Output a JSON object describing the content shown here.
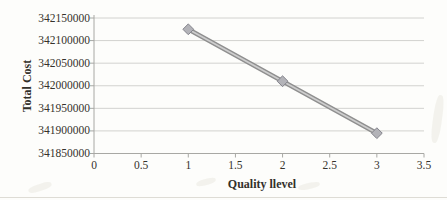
{
  "chart_data": {
    "type": "line",
    "title": "",
    "xlabel": "Quality llevel",
    "ylabel": "Total Cost",
    "x": [
      1,
      2,
      3
    ],
    "series": [
      {
        "name": "Total Cost",
        "values": [
          342125000,
          342010000,
          341895000
        ]
      }
    ],
    "xlim": [
      0,
      3.5
    ],
    "ylim": [
      341850000,
      342150000
    ],
    "x_tick_values": [
      0,
      0.5,
      1,
      1.5,
      2,
      2.5,
      3,
      3.5
    ],
    "x_ticks": [
      "0",
      "0.5",
      "1",
      "1.5",
      "2",
      "2.5",
      "3",
      "3.5"
    ],
    "y_tick_values": [
      341850000,
      341900000,
      341950000,
      342000000,
      342050000,
      342100000,
      342150000
    ],
    "y_ticks": [
      "341850000",
      "341900000",
      "341950000",
      "342000000",
      "342050000",
      "342100000",
      "342150000"
    ],
    "grid": true,
    "legend": false,
    "marker": "diamond",
    "colors": {
      "background": "#fdfdfb",
      "grid": "#d2d2cf",
      "axis": "#a8a8a4",
      "line_edge": "#8f8f8f",
      "line_highlight": "#cdcdcd",
      "marker_fill": "#b3b3b8",
      "marker_edge": "#84848c",
      "text": "#35322c"
    }
  }
}
